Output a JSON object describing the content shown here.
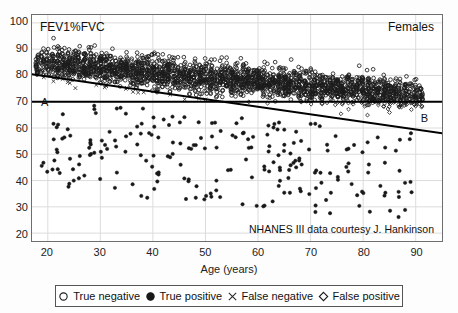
{
  "chart_data": {
    "type": "scatter",
    "title": "FEV1%FVC",
    "group_label": "Females",
    "xlabel": "Age (years)",
    "ylabel": "FEV1%FVC",
    "xlim": [
      17,
      95
    ],
    "ylim": [
      17,
      103
    ],
    "xticks": [
      20,
      30,
      40,
      50,
      60,
      70,
      80,
      90
    ],
    "yticks": [
      20,
      30,
      40,
      50,
      60,
      70,
      80,
      90,
      100
    ],
    "grid": true,
    "source_note": "NHANES III data courtesy J. Hankinson",
    "line_labels": [
      {
        "id": "A",
        "text": "A",
        "meaning": "lower-limit-of-normal regression line"
      },
      {
        "id": "B",
        "text": "B",
        "meaning": "fixed ratio 70% line"
      }
    ],
    "lines": [
      {
        "name": "A",
        "label": "A",
        "description": "Age-dependent lower limit of normal (sloped)",
        "x": [
          17,
          95
        ],
        "y": [
          80.5,
          58.0
        ],
        "color": "#000000",
        "width": 2
      },
      {
        "name": "B",
        "label": "B",
        "description": "Fixed ratio FEV1%FVC = 70 (horizontal)",
        "x": [
          17,
          95
        ],
        "y": [
          70,
          70
        ],
        "color": "#000000",
        "width": 2
      }
    ],
    "legend": {
      "position": "below-axes",
      "entries": [
        {
          "marker": "open-circle",
          "label": "True negative"
        },
        {
          "marker": "filled-circle",
          "label": "True positive"
        },
        {
          "marker": "cross",
          "label": "False negative"
        },
        {
          "marker": "open-diamond",
          "label": "False positive"
        }
      ]
    },
    "series": [
      {
        "name": "True negative",
        "marker": "open-circle",
        "rule": "above both line A and line B",
        "density": "very high, forms dense vertical columns at each integer age",
        "points_per_age_min": 14,
        "points_per_age_max": 38,
        "y_range": [
          70,
          100
        ]
      },
      {
        "name": "True positive",
        "marker": "filled-circle",
        "rule": "below both line A and line B",
        "density": "sparse scatter",
        "y_range": [
          22,
          70
        ]
      },
      {
        "name": "False negative",
        "marker": "cross",
        "rule": "below line A but above line B (young ages, left of crossing)",
        "density": "band between the two lines, ages 17-48",
        "y_range": [
          70,
          80
        ]
      },
      {
        "name": "False positive",
        "marker": "open-diamond",
        "rule": "above line A but below line B (older ages, right of crossing)",
        "density": "band between the two lines, ages 49-95",
        "y_range": [
          58,
          70
        ]
      }
    ],
    "line_crossing_age": 48.5,
    "line_crossing_value": 70
  }
}
